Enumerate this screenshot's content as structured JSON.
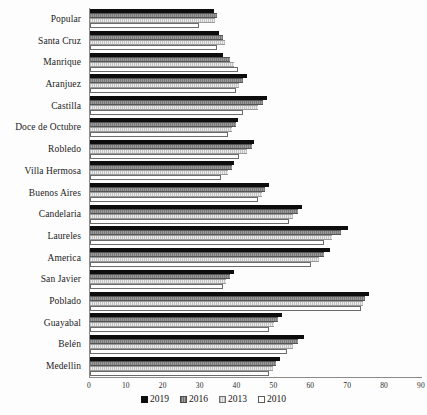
{
  "chart_data": {
    "type": "bar",
    "orientation": "horizontal",
    "title": "",
    "subtitle": "",
    "xlabel": "",
    "ylabel": "",
    "xlim": [
      0,
      90
    ],
    "xticks": [
      0,
      10,
      20,
      30,
      40,
      50,
      60,
      70,
      80,
      90
    ],
    "grid": false,
    "legend_position": "bottom",
    "categories": [
      "Popular",
      "Santa Cruz",
      "Manrique",
      "Aranjuez",
      "Castilla",
      "Doce de Octubre",
      "Robledo",
      "Villa Hermosa",
      "Buenos Aires",
      "Candelaria",
      "Laureles",
      "America",
      "San Javier",
      "Poblado",
      "Guayabal",
      "Belén",
      "Medellin"
    ],
    "series": [
      {
        "name": "2019",
        "color": "#0d0d0d",
        "values": [
          33.5,
          35.0,
          36.0,
          42.5,
          48.0,
          40.0,
          44.5,
          39.0,
          48.5,
          57.5,
          70.0,
          65.0,
          39.0,
          75.5,
          52.0,
          58.0,
          51.5
        ]
      },
      {
        "name": "2016",
        "color": "#8f8f8f",
        "values": [
          34.5,
          36.0,
          38.0,
          41.5,
          47.0,
          39.5,
          44.0,
          38.5,
          47.5,
          56.5,
          68.0,
          63.5,
          38.0,
          74.5,
          51.0,
          56.5,
          50.5
        ]
      },
      {
        "name": "2013",
        "color": "#dcdcdc",
        "values": [
          34.0,
          36.5,
          39.0,
          40.5,
          45.5,
          38.5,
          42.5,
          37.5,
          46.5,
          55.0,
          65.5,
          62.0,
          37.0,
          74.0,
          50.0,
          55.0,
          49.5
        ]
      },
      {
        "name": "2010",
        "color": "#ffffff",
        "values": [
          29.5,
          34.5,
          40.0,
          39.5,
          41.5,
          37.5,
          40.5,
          35.5,
          45.5,
          54.0,
          63.5,
          60.0,
          36.0,
          73.5,
          48.5,
          53.5,
          48.5
        ]
      }
    ]
  },
  "legend": {
    "items": [
      {
        "label": "2019",
        "swatch": "series-2019-swatch"
      },
      {
        "label": "2016",
        "swatch": "series-2016-swatch"
      },
      {
        "label": "2013",
        "swatch": "series-2013-swatch"
      },
      {
        "label": "2010",
        "swatch": "series-2010-swatch"
      }
    ]
  }
}
